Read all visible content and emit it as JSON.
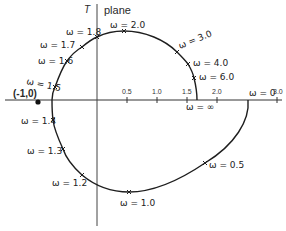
{
  "diagram": {
    "plane_symbol": "T",
    "plane_label": "plane",
    "origin_label": "(-1,0)",
    "axis_ticks": [
      {
        "label": "0.5",
        "value": 0.5
      },
      {
        "label": "1.0",
        "value": 1.0
      },
      {
        "label": "1.5",
        "value": 1.5
      },
      {
        "label": "2.0",
        "value": 2.0
      },
      {
        "label": "3.0",
        "value": 3.0
      }
    ],
    "frequency_labels": {
      "w0": "ω = 0",
      "w05": "ω = 0.5",
      "w10": "ω = 1.0",
      "w12": "ω = 1.2",
      "w13": "ω = 1.3",
      "w14": "ω = 1.4",
      "w15": "ω = 1.5",
      "w16": "ω = 1.6",
      "w17": "ω = 1.7",
      "w18": "ω = 1.8",
      "w20": "ω = 2.0",
      "w30": "ω = 3.0",
      "w40": "ω = 4.0",
      "w60": "ω = 6.0",
      "winf": "ω = ∞"
    }
  },
  "colors": {
    "line": "#1e1e1e",
    "background": "#ffffff"
  }
}
